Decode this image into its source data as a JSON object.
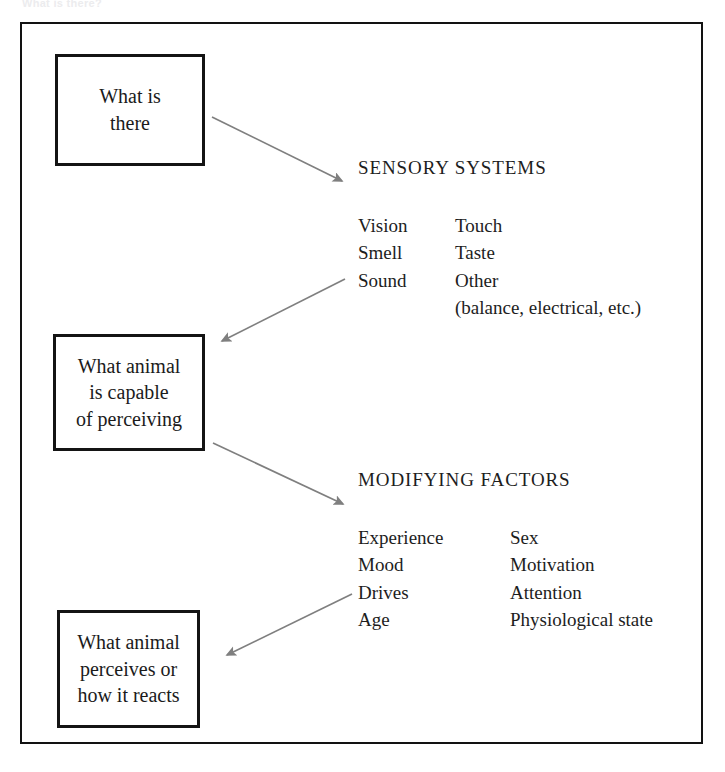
{
  "page": {
    "scan_caption": "What is there?",
    "background_color": "#ffffff",
    "frame_color": "#121212",
    "box_border_color": "#141414",
    "arrow_color": "#7f7f7f",
    "text_color": "#1d1d1d"
  },
  "boxes": [
    {
      "id": "what-is-there",
      "text": "What is\nthere"
    },
    {
      "id": "what-animal-is-capable",
      "text": "What animal\nis capable\nof perceiving"
    },
    {
      "id": "what-animal-perceives",
      "text": "What animal\nperceives or\nhow it reacts"
    }
  ],
  "sections": [
    {
      "id": "sensory-systems",
      "heading": "SENSORY SYSTEMS",
      "col1": [
        "Vision",
        "Smell",
        "Sound"
      ],
      "col2": [
        "Touch",
        "Taste",
        "Other"
      ],
      "note": "(balance, electrical, etc.)"
    },
    {
      "id": "modifying-factors",
      "heading": "MODIFYING FACTORS",
      "col1": [
        "Experience",
        "Mood",
        "Drives",
        "Age"
      ],
      "col2": [
        "Sex",
        "Motivation",
        "Attention",
        "Physiological state"
      ]
    }
  ],
  "arrows": [
    {
      "id": "arrow-what-is-there-to-sensory",
      "from": "what-is-there",
      "to": "sensory-systems",
      "direction": "down-right"
    },
    {
      "id": "arrow-sensory-to-capable",
      "from": "sensory-systems",
      "to": "what-animal-is-capable",
      "direction": "down-left"
    },
    {
      "id": "arrow-capable-to-modifying",
      "from": "what-animal-is-capable",
      "to": "modifying-factors",
      "direction": "down-right"
    },
    {
      "id": "arrow-modifying-to-perceives",
      "from": "modifying-factors",
      "to": "what-animal-perceives",
      "direction": "down-left"
    }
  ]
}
